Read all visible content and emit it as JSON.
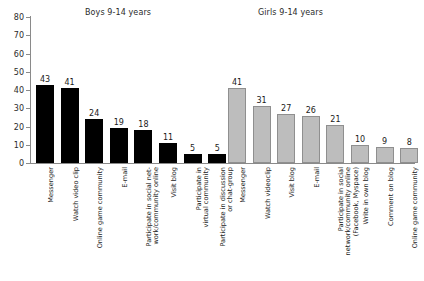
{
  "chart_data": {
    "type": "bar",
    "title": "",
    "xlabel": "",
    "ylabel": "",
    "ylim": [
      0,
      80
    ],
    "yticks": [
      0,
      10,
      20,
      30,
      40,
      50,
      60,
      70,
      80
    ],
    "grid": false,
    "legend": "none",
    "group_headers": {
      "boys": "Boys 9-14 years",
      "girls": "Girls 9-14 years"
    },
    "colors": {
      "boys_bar": "#000000",
      "girls_bar": "#bdbdbd",
      "girls_bar_border": "#8f8f8f",
      "axis": "#8a8a8a",
      "text": "#1a1a1a"
    },
    "series": [
      {
        "name": "Boys 9-14 years",
        "color": "#000000",
        "categories": [
          "Messenger",
          "Watch video clip",
          "Online game community",
          "E-mail",
          "Participate in social net-work/community online",
          "Visit blog",
          "Participate in virtual community",
          "Participate in discussion or chat-group"
        ],
        "values": [
          43,
          41,
          24,
          19,
          18,
          11,
          5,
          5
        ]
      },
      {
        "name": "Girls 9-14 years",
        "color": "#bdbdbd",
        "categories": [
          "Messenger",
          "Watch videoclip",
          "Visit blog",
          "E-mail",
          "Participate in social network/community online (Facebook, Myspace)",
          "Write in own blog",
          "Comment on blog",
          "Online game community"
        ],
        "values": [
          41,
          31,
          27,
          26,
          21,
          10,
          9,
          8
        ]
      }
    ]
  },
  "labels": {
    "y": [
      "0",
      "10",
      "20",
      "30",
      "40",
      "50",
      "60",
      "70",
      "80"
    ],
    "boys_values": [
      "43",
      "41",
      "24",
      "19",
      "18",
      "11",
      "5",
      "5"
    ],
    "girls_values": [
      "41",
      "31",
      "27",
      "26",
      "21",
      "10",
      "9",
      "8"
    ],
    "boys_cats": [
      {
        "l1": "Messenger",
        "l2": ""
      },
      {
        "l1": "Watch video clip",
        "l2": ""
      },
      {
        "l1": "Online game community",
        "l2": ""
      },
      {
        "l1": "E-mail",
        "l2": ""
      },
      {
        "l1": "Participate in social net-",
        "l2": "work/community online"
      },
      {
        "l1": "Visit blog",
        "l2": ""
      },
      {
        "l1": "Participate in",
        "l2": "virtual community"
      },
      {
        "l1": "Participate in discussion",
        "l2": "or chat-group"
      }
    ],
    "girls_cats": [
      {
        "l1": "Messenger",
        "l2": ""
      },
      {
        "l1": "Watch videoclip",
        "l2": ""
      },
      {
        "l1": "Visit blog",
        "l2": ""
      },
      {
        "l1": "E-mail",
        "l2": ""
      },
      {
        "l1": "Participate in social",
        "l2": "network/community online",
        "l3": "(Facebook, Myspace)"
      },
      {
        "l1": "Write in own blog",
        "l2": ""
      },
      {
        "l1": "Comment on blog",
        "l2": ""
      },
      {
        "l1": "Online game community",
        "l2": ""
      }
    ]
  }
}
